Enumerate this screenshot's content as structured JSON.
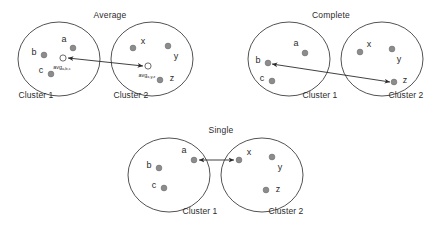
{
  "figure": {
    "background": "#ffffff",
    "circle_stroke": "#3f3f3f",
    "point_fill": "#8c8c8c",
    "point_stroke": "#6f6f6f",
    "arrow_color": "#2b2b2b",
    "centroid_fill": "#ffffff",
    "centroid_stroke": "#5a5a5a"
  },
  "panels": [
    {
      "id": "average",
      "title": "Average",
      "title_x": 110,
      "title_y": 10,
      "circles": [
        {
          "name": "cluster-1-circle",
          "cx": 59,
          "cy": 59,
          "rx": 41,
          "ry": 37
        },
        {
          "name": "cluster-2-circle",
          "cx": 152,
          "cy": 59,
          "rx": 41,
          "ry": 37
        }
      ],
      "captions": [
        {
          "text": "Cluster 1",
          "x": 36,
          "y": 90
        },
        {
          "text": "Cluster 2",
          "x": 131,
          "y": 90
        }
      ],
      "points": [
        {
          "id": "a",
          "label": "a",
          "cx": 73,
          "cy": 48,
          "label_x": 64,
          "label_y": 39
        },
        {
          "id": "b",
          "label": "b",
          "cx": 44,
          "cy": 55,
          "label_x": 34,
          "label_y": 52
        },
        {
          "id": "c",
          "label": "c",
          "cx": 51,
          "cy": 74,
          "label_x": 41,
          "label_y": 70
        },
        {
          "id": "x",
          "label": "x",
          "cx": 133,
          "cy": 48,
          "label_x": 143,
          "label_y": 41
        },
        {
          "id": "y",
          "label": "y",
          "cx": 168,
          "cy": 46,
          "label_x": 176,
          "label_y": 56
        },
        {
          "id": "z",
          "label": "z",
          "cx": 160,
          "cy": 80,
          "label_x": 172,
          "label_y": 78
        }
      ],
      "centroids": [
        {
          "id": "avg-left",
          "cx": 63,
          "cy": 58,
          "r": 3.1,
          "label": "avg",
          "subscript": "a,b,c",
          "label_x": 62,
          "label_y": 67
        },
        {
          "id": "avg-right",
          "cx": 148,
          "cy": 66,
          "r": 3.1,
          "label": "avg",
          "subscript": "x,y,z",
          "label_x": 147,
          "label_y": 75
        }
      ],
      "arrows": [
        {
          "name": "average-linkage-arrow",
          "x1": 68,
          "y1": 58,
          "x2": 143,
          "y2": 66,
          "double": true
        }
      ]
    },
    {
      "id": "complete",
      "title": "Complete",
      "title_x": 331,
      "title_y": 10,
      "circles": [
        {
          "name": "cluster-1-circle",
          "cx": 289,
          "cy": 59,
          "rx": 41,
          "ry": 37
        },
        {
          "name": "cluster-2-circle",
          "cx": 382,
          "cy": 59,
          "rx": 41,
          "ry": 37
        }
      ],
      "captions": [
        {
          "text": "Cluster 1",
          "x": 320,
          "y": 90
        },
        {
          "text": "Cluster 2",
          "x": 406,
          "y": 90
        }
      ],
      "points": [
        {
          "id": "a",
          "label": "a",
          "cx": 305,
          "cy": 53,
          "label_x": 296,
          "label_y": 43
        },
        {
          "id": "b",
          "label": "b",
          "cx": 268,
          "cy": 63,
          "label_x": 258,
          "label_y": 60
        },
        {
          "id": "c",
          "label": "c",
          "cx": 272,
          "cy": 81,
          "label_x": 262,
          "label_y": 78
        },
        {
          "id": "x",
          "label": "x",
          "cx": 360,
          "cy": 52,
          "label_x": 369,
          "label_y": 44
        },
        {
          "id": "y",
          "label": "y",
          "cx": 392,
          "cy": 49,
          "label_x": 399,
          "label_y": 59
        },
        {
          "id": "z",
          "label": "z",
          "cx": 394,
          "cy": 82,
          "label_x": 405,
          "label_y": 80
        }
      ],
      "centroids": [],
      "arrows": [
        {
          "name": "complete-linkage-arrow",
          "x1": 272,
          "y1": 64,
          "x2": 390,
          "y2": 82,
          "double": true
        }
      ]
    },
    {
      "id": "single",
      "title": "Single",
      "title_x": 221,
      "title_y": 125,
      "circles": [
        {
          "name": "cluster-1-circle",
          "cx": 169,
          "cy": 175,
          "rx": 41,
          "ry": 37
        },
        {
          "name": "cluster-2-circle",
          "cx": 262,
          "cy": 175,
          "rx": 41,
          "ry": 37
        }
      ],
      "captions": [
        {
          "text": "Cluster 1",
          "x": 200,
          "y": 206
        },
        {
          "text": "Cluster 2",
          "x": 286,
          "y": 206
        }
      ],
      "points": [
        {
          "id": "a",
          "label": "a",
          "cx": 194,
          "cy": 160,
          "label_x": 184,
          "label_y": 150
        },
        {
          "id": "b",
          "label": "b",
          "cx": 159,
          "cy": 168,
          "label_x": 149,
          "label_y": 165
        },
        {
          "id": "c",
          "label": "c",
          "cx": 164,
          "cy": 188,
          "label_x": 154,
          "label_y": 185
        },
        {
          "id": "x",
          "label": "x",
          "cx": 239,
          "cy": 160,
          "label_x": 249,
          "label_y": 152
        },
        {
          "id": "y",
          "label": "y",
          "cx": 272,
          "cy": 157,
          "label_x": 280,
          "label_y": 167
        },
        {
          "id": "z",
          "label": "z",
          "cx": 266,
          "cy": 190,
          "label_x": 278,
          "label_y": 189
        }
      ],
      "centroids": [],
      "arrows": [
        {
          "name": "single-linkage-arrow",
          "x1": 199,
          "y1": 160,
          "x2": 234,
          "y2": 160,
          "double": true
        }
      ]
    }
  ]
}
